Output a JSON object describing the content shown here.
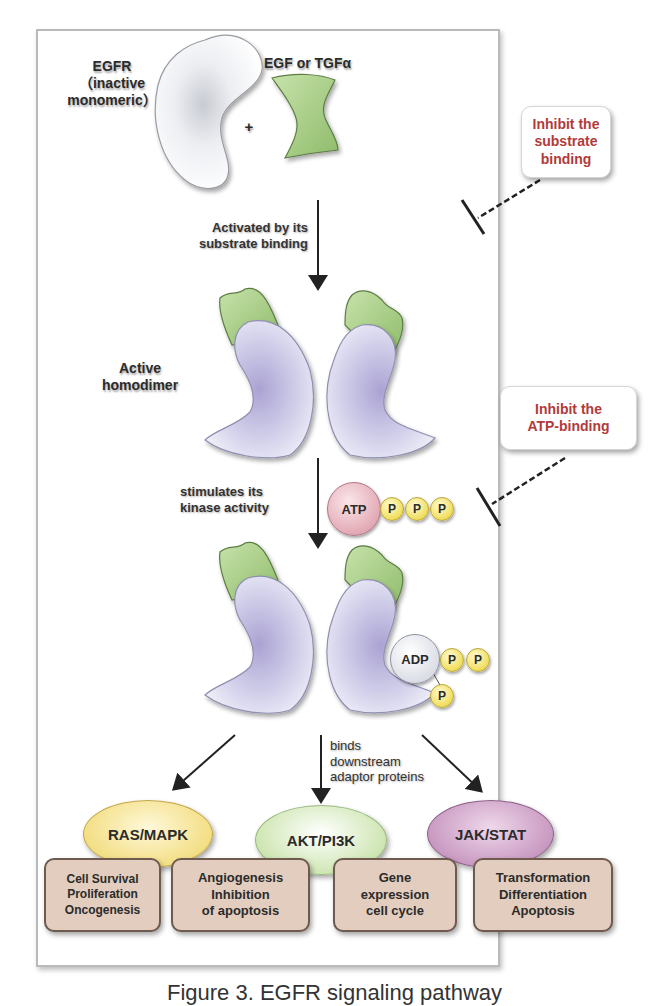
{
  "figure": {
    "caption": "Figure 3. EGFR signaling pathway"
  },
  "stage1": {
    "receptor_label_line1": "EGFR",
    "receptor_label_line2": "（inactive",
    "receptor_label_line3": "monomeric）",
    "ligand_label": "EGF or TGFα",
    "plus": "+"
  },
  "step1": {
    "arrow_label_line1": "Activated by its",
    "arrow_label_line2": "substrate binding"
  },
  "inhibitor1": {
    "line1": "Inhibit the",
    "line2": "substrate",
    "line3": "binding"
  },
  "stage2": {
    "label_line1": "Active",
    "label_line2": "homodimer"
  },
  "inhibitor2": {
    "line1": "Inhibit the",
    "line2": "ATP-binding"
  },
  "step2": {
    "arrow_label_line1": "stimulates its",
    "arrow_label_line2": "kinase activity",
    "atp": "ATP",
    "phosphates": [
      "P",
      "P",
      "P"
    ]
  },
  "stage3": {
    "adp": "ADP",
    "phosphates": [
      "P",
      "P",
      "P"
    ]
  },
  "step3": {
    "arrow_label_line1": "binds",
    "arrow_label_line2": "downstream",
    "arrow_label_line3": "adaptor proteins"
  },
  "pathways": [
    {
      "label": "RAS/MAPK",
      "color": "#f3df86"
    },
    {
      "label": "AKT/PI3K",
      "color": "#cfe6b3"
    },
    {
      "label": "JAK/STAT",
      "color": "#c99ac2"
    }
  ],
  "outcomes": [
    {
      "line1": "Cell Survival",
      "line2": "Proliferation",
      "line3": "Oncogenesis"
    },
    {
      "line1": "Angiogenesis",
      "line2": "Inhibition",
      "line3": "of apoptosis"
    },
    {
      "line1": "Gene",
      "line2": "expression",
      "line3": "cell cycle"
    },
    {
      "line1": "Transformation",
      "line2": "Differentiation",
      "line3": "Apoptosis"
    }
  ],
  "colors": {
    "receptor_inactive": "#f4f5f8",
    "receptor_active": "#c9c5e4",
    "ligand": "#a8cc84",
    "inhibit_text": "#b23a3a",
    "atp": "#e6aab5",
    "phosphate": "#f0de5a",
    "outcome_box": "#e2cdbf"
  }
}
